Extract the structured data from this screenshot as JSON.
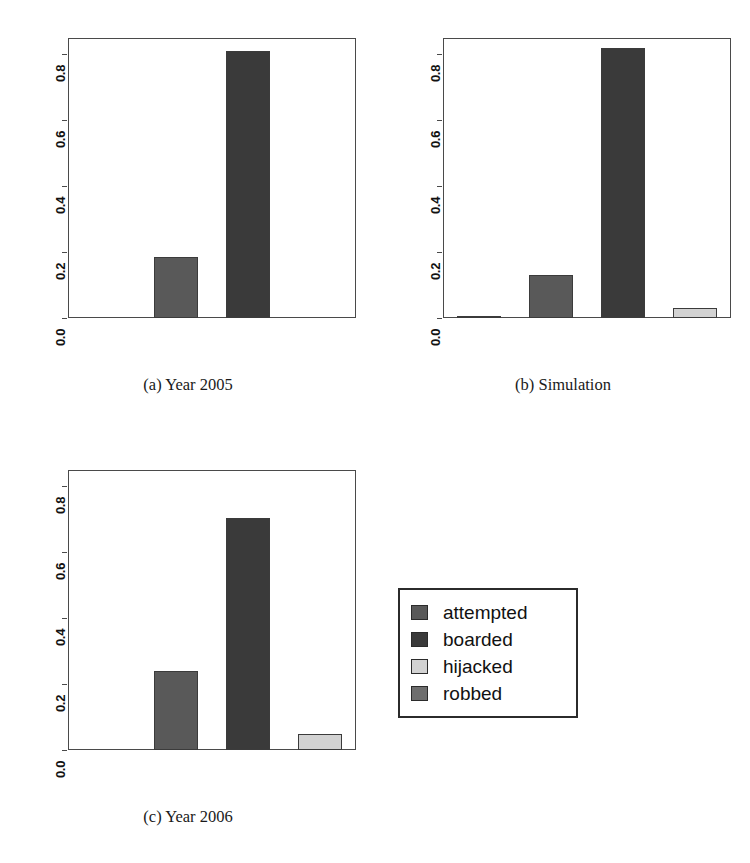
{
  "scan_artifact_top": "",
  "legend": {
    "entries": [
      {
        "label": "attempted",
        "color": "#595959"
      },
      {
        "label": "boarded",
        "color": "#3a3a3a"
      },
      {
        "label": "hijacked",
        "color": "#d2d2d2"
      },
      {
        "label": "robbed",
        "color": "#6e6e6e"
      }
    ]
  },
  "chart_data": [
    {
      "type": "bar",
      "title": "",
      "caption": "(a) Year 2005",
      "categories": [
        "robbed",
        "attempted",
        "boarded",
        "hijacked"
      ],
      "values": [
        0.0,
        0.185,
        0.81,
        0.0
      ],
      "colors": [
        "#6e6e6e",
        "#595959",
        "#3a3a3a",
        "#d2d2d2"
      ],
      "xlabel": "",
      "ylabel": "",
      "ylim": [
        0,
        0.85
      ],
      "yticks": [
        0.0,
        0.2,
        0.4,
        0.6,
        0.8
      ],
      "yticklabels": [
        "0.0",
        "0.2",
        "0.4",
        "0.6",
        "0.8"
      ],
      "grid": false,
      "legend_position": "external"
    },
    {
      "type": "bar",
      "title": "",
      "caption": "(b) Simulation",
      "categories": [
        "robbed",
        "attempted",
        "boarded",
        "hijacked"
      ],
      "values": [
        0.006,
        0.13,
        0.82,
        0.03
      ],
      "colors": [
        "#6e6e6e",
        "#595959",
        "#3a3a3a",
        "#d2d2d2"
      ],
      "xlabel": "",
      "ylabel": "",
      "ylim": [
        0,
        0.85
      ],
      "yticks": [
        0.0,
        0.2,
        0.4,
        0.6,
        0.8
      ],
      "yticklabels": [
        "0.0",
        "0.2",
        "0.4",
        "0.6",
        "0.8"
      ],
      "grid": false,
      "legend_position": "external"
    },
    {
      "type": "bar",
      "title": "",
      "caption": "(c) Year 2006",
      "categories": [
        "robbed",
        "attempted",
        "boarded",
        "hijacked"
      ],
      "values": [
        0.0,
        0.24,
        0.705,
        0.05
      ],
      "colors": [
        "#6e6e6e",
        "#595959",
        "#3a3a3a",
        "#d2d2d2"
      ],
      "xlabel": "",
      "ylabel": "",
      "ylim": [
        0,
        0.85
      ],
      "yticks": [
        0.0,
        0.2,
        0.4,
        0.6,
        0.8
      ],
      "yticklabels": [
        "0.0",
        "0.2",
        "0.4",
        "0.6",
        "0.8"
      ],
      "grid": false,
      "legend_position": "external"
    }
  ]
}
